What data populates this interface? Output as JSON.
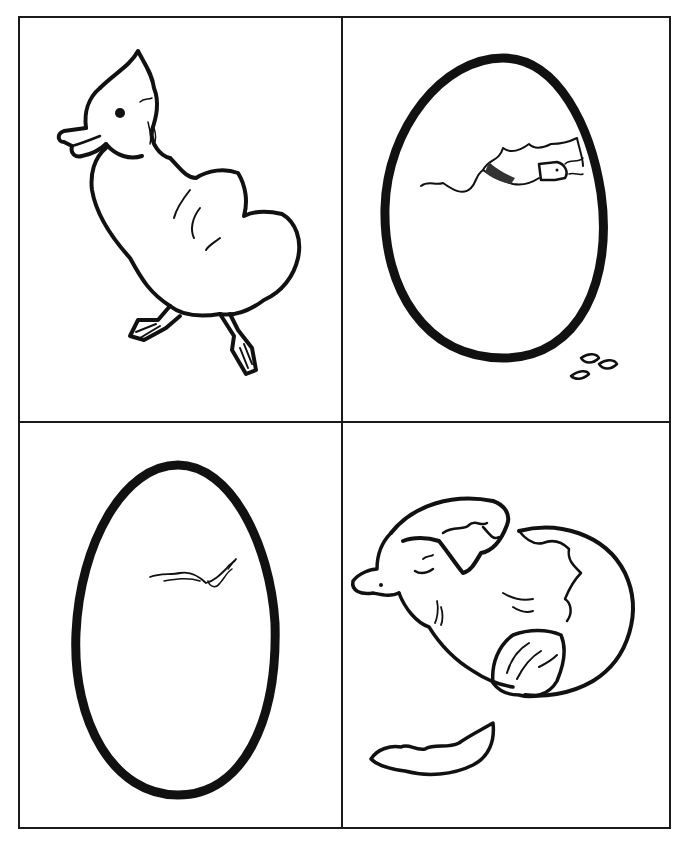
{
  "worksheet": {
    "layout": "2x2 grid",
    "ink_color": "#111111",
    "paper_color": "#ffffff",
    "panels": [
      {
        "position": "top-left",
        "subject": "duckling-walking"
      },
      {
        "position": "top-right",
        "subject": "egg-with-beak-poking-through"
      },
      {
        "position": "bottom-left",
        "subject": "egg-with-small-crack"
      },
      {
        "position": "bottom-right",
        "subject": "duckling-hatching-from-shell"
      }
    ]
  }
}
